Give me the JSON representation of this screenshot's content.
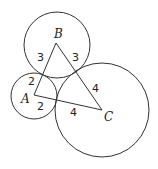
{
  "diagram": {
    "type": "geometry",
    "vertices": [
      {
        "name": "A",
        "label": "A",
        "x": 34,
        "y": 95
      },
      {
        "name": "B",
        "label": "B",
        "x": 56,
        "y": 43
      },
      {
        "name": "C",
        "label": "C",
        "x": 102,
        "y": 110
      }
    ],
    "circles": [
      {
        "center": "A",
        "cx": 34,
        "cy": 96,
        "r": 23
      },
      {
        "center": "B",
        "cx": 57,
        "cy": 45,
        "r": 33
      },
      {
        "center": "C",
        "cx": 102,
        "cy": 110,
        "r": 47
      }
    ],
    "segment_labels": [
      {
        "id": "ab_near_b",
        "text": "3",
        "x": 41,
        "y": 61
      },
      {
        "id": "bc_near_b",
        "text": "3",
        "x": 76,
        "y": 61
      },
      {
        "id": "ab_near_a",
        "text": "2",
        "x": 32,
        "y": 85
      },
      {
        "id": "ac_near_a",
        "text": "2",
        "x": 41,
        "y": 110
      },
      {
        "id": "bc_near_c",
        "text": "4",
        "x": 96,
        "y": 92
      },
      {
        "id": "ac_near_c",
        "text": "4",
        "x": 74,
        "y": 116
      }
    ],
    "vertex_labels": [
      {
        "id": "label_a",
        "text": "A",
        "x": 24,
        "y": 103
      },
      {
        "id": "label_b",
        "text": "B",
        "x": 54,
        "y": 38
      },
      {
        "id": "label_c",
        "text": "C",
        "x": 105,
        "y": 121
      }
    ]
  }
}
